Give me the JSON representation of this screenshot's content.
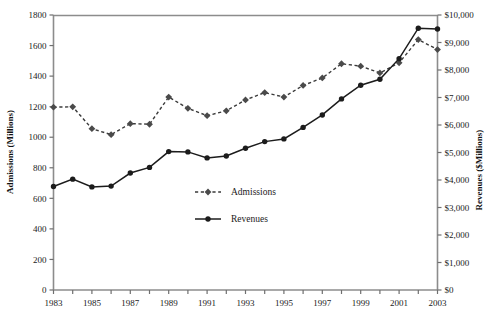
{
  "chart_data": {
    "type": "line",
    "title": "",
    "xlabel": "",
    "ylabel": "Admissions (Millions)",
    "y2label": "Revenues ($Millions)",
    "grid": false,
    "legend_position": "center",
    "x": [
      1983,
      1984,
      1985,
      1986,
      1987,
      1988,
      1989,
      1990,
      1991,
      1992,
      1993,
      1994,
      1995,
      1996,
      1997,
      1998,
      1999,
      2000,
      2001,
      2002,
      2003
    ],
    "xtick_labels": [
      "1983",
      "",
      "1985",
      "",
      "1987",
      "",
      "1989",
      "",
      "1991",
      "",
      "1993",
      "",
      "1995",
      "",
      "1997",
      "",
      "1999",
      "",
      "2001",
      "",
      "2003"
    ],
    "xticks_all": [
      1983,
      1984,
      1985,
      1986,
      1987,
      1988,
      1989,
      1990,
      1991,
      1992,
      1993,
      1994,
      1995,
      1996,
      1997,
      1998,
      1999,
      2000,
      2001,
      2002,
      2003
    ],
    "ylim": [
      0,
      1800
    ],
    "yticks": [
      0,
      200,
      400,
      600,
      800,
      1000,
      1200,
      1400,
      1600,
      1800
    ],
    "ytick_labels": [
      "0",
      "200",
      "400",
      "600",
      "800",
      "1000",
      "1200",
      "1400",
      "1600",
      "1800"
    ],
    "y2lim": [
      0,
      10000
    ],
    "y2ticks": [
      0,
      1000,
      2000,
      3000,
      4000,
      5000,
      6000,
      7000,
      8000,
      9000,
      10000
    ],
    "y2tick_labels": [
      "$0",
      "$1,000",
      "$2,000",
      "$3,000",
      "$4,000",
      "$5,000",
      "$6,000",
      "$7,000",
      "$8,000",
      "$9,000",
      "$10,000"
    ],
    "series": [
      {
        "name": "Admissions",
        "axis": "left",
        "units": "Millions",
        "marker": "diamond",
        "line_style": "dashed",
        "color": "#4a4a4a",
        "values": [
          1197,
          1199,
          1056,
          1017,
          1089,
          1085,
          1263,
          1189,
          1141,
          1173,
          1244,
          1292,
          1263,
          1339,
          1388,
          1481,
          1465,
          1421,
          1487,
          1639,
          1574
        ]
      },
      {
        "name": "Revenues",
        "axis": "right",
        "units": "$Millions",
        "marker": "circle",
        "line_style": "solid",
        "color": "#1c1c1c",
        "values": [
          3766,
          4031,
          3749,
          3779,
          4253,
          4458,
          5033,
          5022,
          4803,
          4871,
          5154,
          5396,
          5494,
          5912,
          6366,
          6949,
          7448,
          7661,
          8413,
          9520,
          9490
        ]
      }
    ],
    "legend": [
      {
        "label": "Admissions",
        "marker": "diamond",
        "line_style": "dashed",
        "color": "#4a4a4a"
      },
      {
        "label": "Revenues",
        "marker": "circle",
        "line_style": "solid",
        "color": "#1c1c1c"
      }
    ]
  }
}
